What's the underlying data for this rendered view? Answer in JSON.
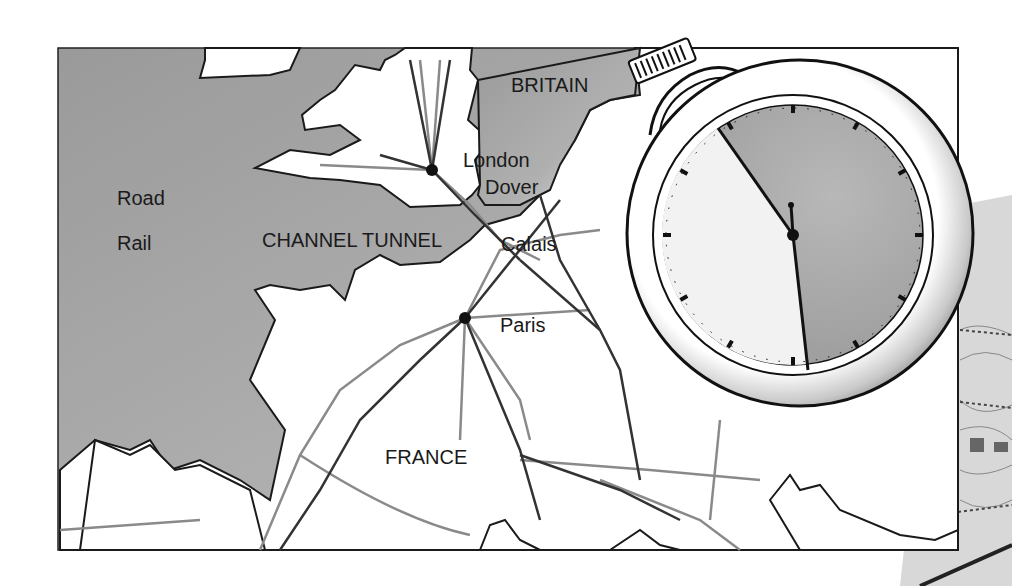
{
  "map": {
    "title": "Channel Tunnel route map",
    "labels": {
      "britain": "BRITAIN",
      "london": "London",
      "dover": "Dover",
      "calais": "Calais",
      "paris": "Paris",
      "france": "FRANCE",
      "channel_tunnel": "CHANNEL TUNNEL"
    },
    "legend": {
      "road": "Road",
      "rail": "Rail"
    },
    "colors": {
      "sea": "#a8a8a8",
      "land": "#ffffff",
      "coast": "#1a1a1a",
      "road": "#333333",
      "rail": "#8a8a8a"
    }
  },
  "stopwatch": {
    "minute_hand_angle_deg": -33,
    "second_hand_angle_deg": 175
  }
}
